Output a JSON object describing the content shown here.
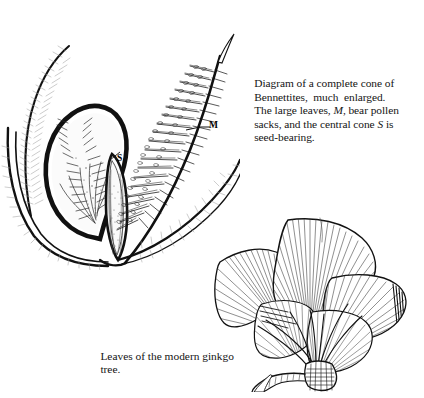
{
  "figure": {
    "background_color": "#ffffff",
    "ink_color": "#111111"
  },
  "captions": {
    "bennettites": {
      "line1": "Diagram of a complete cone of",
      "line2": "Bennettites,  much  enlarged.",
      "line3_a": "The large leaves, ",
      "line3_italic": "M",
      "line3_b": ", bear pollen",
      "line4_a": "sacks, and the central cone ",
      "line4_italic": "S",
      "line4_b": " is",
      "line5": "seed-bearing."
    },
    "ginkgo": {
      "line1": "Leaves of the modern ginkgo",
      "line2": "tree."
    }
  },
  "labels": {
    "pollen_leaf": "M",
    "seed_cone": "S"
  },
  "illustrations": {
    "cone": {
      "name": "bennettites-cone-diagram",
      "description": "Pen-and-ink cutaway of a Bennettites cone with pinnate pollen-bearing leaves and a central seed cone"
    },
    "ginkgo": {
      "name": "ginkgo-leaf-cluster",
      "description": "Pen-and-ink cluster of fan-shaped ginkgo leaves on a short woody spur shoot"
    }
  }
}
